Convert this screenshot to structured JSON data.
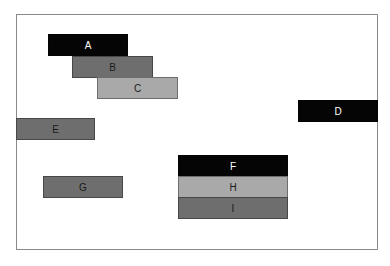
{
  "diagram": {
    "boxes": [
      {
        "id": "A",
        "label": "A",
        "shade": "black"
      },
      {
        "id": "B",
        "label": "B",
        "shade": "dark-gray"
      },
      {
        "id": "C",
        "label": "C",
        "shade": "light-gray"
      },
      {
        "id": "D",
        "label": "D",
        "shade": "black"
      },
      {
        "id": "E",
        "label": "E",
        "shade": "dark-gray"
      },
      {
        "id": "F",
        "label": "F",
        "shade": "black"
      },
      {
        "id": "G",
        "label": "G",
        "shade": "dark-gray"
      },
      {
        "id": "H",
        "label": "H",
        "shade": "light-gray"
      },
      {
        "id": "I",
        "label": "I",
        "shade": "dark-gray"
      }
    ],
    "colors": {
      "black": "#050505",
      "dark-gray": "#6e6e6e",
      "light-gray": "#a9a9a9",
      "frame": "#8a8a8a"
    }
  }
}
